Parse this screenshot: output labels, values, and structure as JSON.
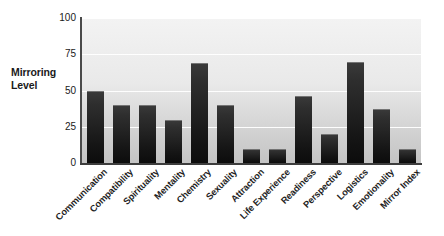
{
  "chart_data": {
    "type": "bar",
    "title": "",
    "subtitle": "",
    "xlabel": "",
    "ylabel": "Mirroring Level",
    "ylabel_lines": [
      "Mirroring",
      "Level"
    ],
    "categories": [
      "Communication",
      "Compatibility",
      "Spirituality",
      "Mentality",
      "Chemistry",
      "Sexuality",
      "Attraction",
      "Life Experience",
      "Readiness",
      "Perspective",
      "Logistics",
      "Emotionality",
      "Mirror Index"
    ],
    "values": [
      50,
      40,
      40,
      30,
      69,
      40,
      10,
      10,
      46,
      20,
      70,
      37,
      10
    ],
    "ylim": [
      0,
      100
    ],
    "yticks": [
      0,
      25,
      50,
      75,
      100
    ],
    "ytick_labels": [
      "0",
      "25",
      "50",
      "75",
      "100"
    ],
    "grid": true,
    "grid_color": "#ffffff",
    "legend": null,
    "legend_position": "none",
    "bar_color": "#1d1d1d",
    "plot_background": "#e4e4e4",
    "axis_color": "#3d3d3d",
    "xtick_rotation": -45
  }
}
